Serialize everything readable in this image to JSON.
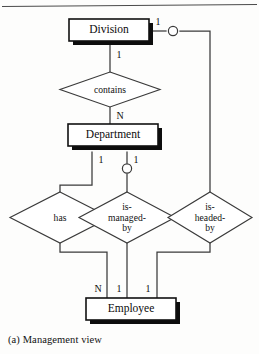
{
  "figure": {
    "caption": "(a) Management view",
    "diagram_type": "entity-relationship-diagram",
    "notation": "Chen ER with shadowed entity boxes",
    "colors": {
      "background": "#fdfdfc",
      "line": "#3a3a3a",
      "entity_border": "#111111",
      "entity_fill": "#ffffff",
      "shadow": "#0d0d0d",
      "text": "#0b0b0b"
    }
  },
  "entities": [
    {
      "id": "division",
      "label": "Division"
    },
    {
      "id": "department",
      "label": "Department"
    },
    {
      "id": "employee",
      "label": "Employee"
    }
  ],
  "relationships": [
    {
      "id": "contains",
      "label": "contains"
    },
    {
      "id": "has",
      "label": "has"
    },
    {
      "id": "is-managed-by",
      "label_line1": "is-",
      "label_line2": "managed-",
      "label_line3": "by"
    },
    {
      "id": "is-headed-by",
      "label_line1": "is-",
      "label_line2": "headed-",
      "label_line3": "by"
    }
  ],
  "cardinalities": {
    "division_contains": "1",
    "division_is_headed_by": "1",
    "contains_department": "N",
    "department_has": "1",
    "department_is_managed_by": "1",
    "has_employee": "N",
    "is_managed_by_employee": "1",
    "is_headed_by_employee": "1"
  }
}
